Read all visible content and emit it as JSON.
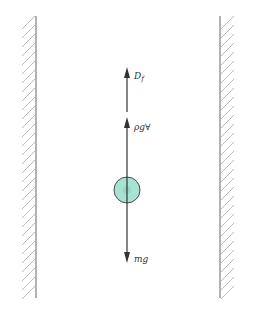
{
  "diagram": {
    "forces": [
      {
        "id": "drag",
        "label_main": "D",
        "label_sub": "f",
        "direction": "up"
      },
      {
        "id": "buoyancy",
        "label": "ρg∀",
        "direction": "up"
      },
      {
        "id": "weight",
        "label": "mg",
        "direction": "down"
      }
    ],
    "colors": {
      "wall": "#999999",
      "hatch": "#aaaaaa",
      "arrow": "#333333",
      "sphere_fill": "#a8e2d2",
      "sphere_stroke": "#4a4a4a"
    }
  }
}
